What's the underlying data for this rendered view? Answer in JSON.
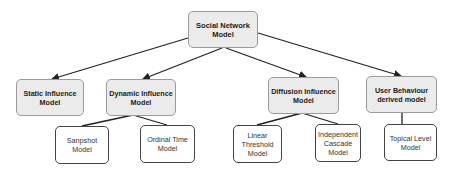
{
  "diagram": {
    "root": {
      "id": "root",
      "label": "Social Network Model",
      "x": 188,
      "y": 11,
      "w": 70,
      "h": 37
    },
    "level1": [
      {
        "id": "static",
        "label": "Static Influence Model",
        "x": 16,
        "y": 79,
        "w": 68,
        "h": 37
      },
      {
        "id": "dynamic",
        "label": "Dynamic Influence Model",
        "x": 106,
        "y": 79,
        "w": 70,
        "h": 37
      },
      {
        "id": "diffusion",
        "label": "Diffusion Influence Model",
        "x": 268,
        "y": 77,
        "w": 71,
        "h": 37
      },
      {
        "id": "userbeh",
        "label": "User Behaviour derived model",
        "x": 366,
        "y": 76,
        "w": 71,
        "h": 37
      }
    ],
    "level2": [
      {
        "id": "snapshot",
        "parent": "dynamic",
        "label": "Sanpshot Model",
        "x": 55,
        "y": 126,
        "w": 54,
        "h": 38
      },
      {
        "id": "ordinal",
        "parent": "dynamic",
        "label": "Ordinal Time Model",
        "x": 140,
        "y": 125,
        "w": 55,
        "h": 38
      },
      {
        "id": "linear",
        "parent": "diffusion",
        "label": "Linear Threshold Model",
        "x": 233,
        "y": 125,
        "w": 49,
        "h": 38
      },
      {
        "id": "indep",
        "parent": "diffusion",
        "label": "Independent Cascade Model",
        "x": 315,
        "y": 124,
        "w": 46,
        "h": 38
      },
      {
        "id": "topical",
        "parent": "userbeh",
        "label": "Topical Level Model",
        "x": 384,
        "y": 124,
        "w": 53,
        "h": 37
      }
    ],
    "edges": [
      {
        "from": "root",
        "to": "static",
        "arrow": true
      },
      {
        "from": "root",
        "to": "dynamic",
        "arrow": true
      },
      {
        "from": "root",
        "to": "diffusion",
        "arrow": true
      },
      {
        "from": "root",
        "to": "userbeh",
        "arrow": true
      },
      {
        "from": "dynamic",
        "to": "snapshot",
        "arrow": false
      },
      {
        "from": "dynamic",
        "to": "ordinal",
        "arrow": false
      },
      {
        "from": "diffusion",
        "to": "linear",
        "arrow": false
      },
      {
        "from": "diffusion",
        "to": "indep",
        "arrow": false
      },
      {
        "from": "userbeh",
        "to": "topical",
        "arrow": false
      }
    ]
  }
}
